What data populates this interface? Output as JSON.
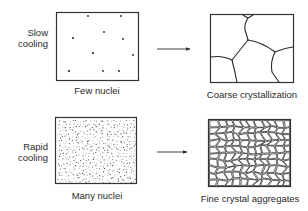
{
  "diagram": {
    "rows": [
      {
        "condition": {
          "line1": "Slow",
          "line2": "cooling"
        },
        "input": {
          "caption": "Few nuclei",
          "nuclei_count": "few"
        },
        "output": {
          "caption": "Coarse crystallization",
          "grain_size": "coarse"
        }
      },
      {
        "condition": {
          "line1": "Rapid",
          "line2": "cooling"
        },
        "input": {
          "caption": "Many nuclei",
          "nuclei_count": "many"
        },
        "output": {
          "caption": "Fine crystal aggregates",
          "grain_size": "fine"
        }
      }
    ],
    "colors": {
      "ink": "#2a2a2a",
      "background": "#ffffff"
    }
  }
}
